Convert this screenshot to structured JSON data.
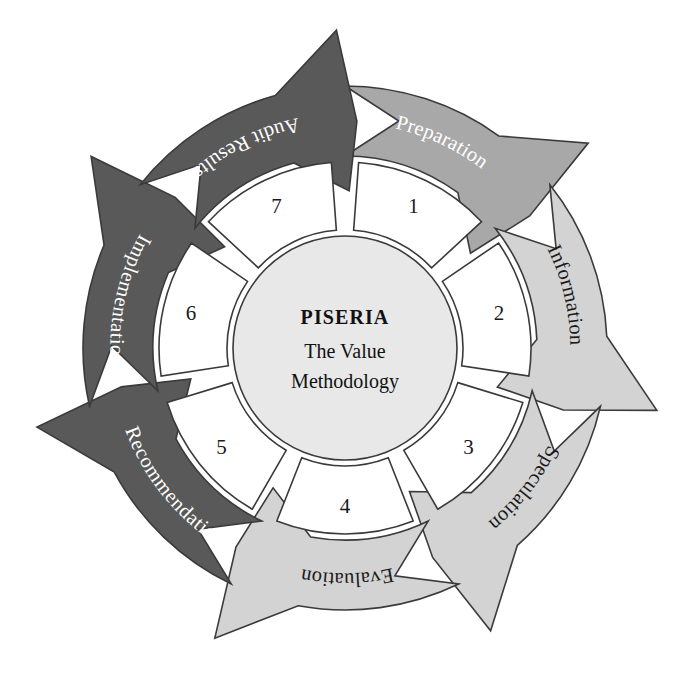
{
  "diagram": {
    "type": "cycle",
    "title_main": "PISERIA",
    "title_line1": "The Value",
    "title_line2": "Methodology",
    "center_x": 345,
    "center_y": 348,
    "hub_radius": 112,
    "sector_inner_radius": 118,
    "sector_outer_radius": 186,
    "band_inner_radius": 192,
    "band_outer_radius": 262,
    "arrow_tip_radius": 318,
    "segment_count": 7,
    "background_color": "#ffffff",
    "outline_color": "#3a3a3a",
    "hub_fill": "#e8e8e8",
    "sector_fill": "#ffffff",
    "palette": {
      "light_gray": "#d3d3d3",
      "medium_gray": "#a8a8a8",
      "dark_gray": "#595959"
    },
    "steps": [
      {
        "number": "1",
        "label": "Preparation",
        "fill": "#a8a8a8",
        "text_color": "#ffffff",
        "start_angle": -90,
        "end_angle": -38.57
      },
      {
        "number": "2",
        "label": "Information",
        "fill": "#d3d3d3",
        "text_color": "#1a1a1a",
        "start_angle": -38.57,
        "end_angle": 12.86
      },
      {
        "number": "3",
        "label": "Speculation",
        "fill": "#d3d3d3",
        "text_color": "#1a1a1a",
        "start_angle": 12.86,
        "end_angle": 64.29
      },
      {
        "number": "4",
        "label": "Evaluation",
        "fill": "#d3d3d3",
        "text_color": "#1a1a1a",
        "start_angle": 64.29,
        "end_angle": 115.71
      },
      {
        "number": "5",
        "label": "Recommendation",
        "fill": "#595959",
        "text_color": "#ffffff",
        "start_angle": 115.71,
        "end_angle": 167.14
      },
      {
        "number": "6",
        "label": "Implementation",
        "fill": "#595959",
        "text_color": "#ffffff",
        "start_angle": 167.14,
        "end_angle": 218.57
      },
      {
        "number": "7",
        "label": "Audit Results",
        "fill": "#595959",
        "text_color": "#ffffff",
        "start_angle": 218.57,
        "end_angle": 270
      }
    ]
  }
}
